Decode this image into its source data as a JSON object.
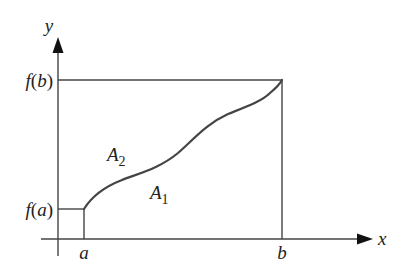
{
  "diagram": {
    "type": "function-area-diagram",
    "axes": {
      "x_label": "x",
      "y_label": "y"
    },
    "ticks": {
      "x": [
        {
          "label": "a"
        },
        {
          "label": "b"
        }
      ],
      "y": [
        {
          "label_fn": "f",
          "label_arg": "a"
        },
        {
          "label_fn": "f",
          "label_arg": "b"
        }
      ]
    },
    "regions": [
      {
        "name": "A",
        "subscript": "2",
        "position": "above curve"
      },
      {
        "name": "A",
        "subscript": "1",
        "position": "below curve"
      }
    ],
    "colors": {
      "line": "#444444",
      "curve": "#444444",
      "text": "#222222",
      "background": "#ffffff"
    }
  }
}
